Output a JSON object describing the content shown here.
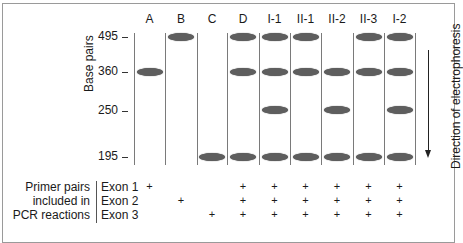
{
  "figure": {
    "y_axis_label": "Base pairs",
    "direction_label": "Direction of electrophoresis",
    "size_markers": [
      "495",
      "360",
      "250",
      "195"
    ],
    "lanes": [
      {
        "label": "A",
        "bands": [
          "360"
        ],
        "primers": {
          "exon1": "+",
          "exon2": "",
          "exon3": ""
        }
      },
      {
        "label": "B",
        "bands": [
          "495"
        ],
        "primers": {
          "exon1": "",
          "exon2": "+",
          "exon3": ""
        }
      },
      {
        "label": "C",
        "bands": [
          "195"
        ],
        "primers": {
          "exon1": "",
          "exon2": "",
          "exon3": "+"
        }
      },
      {
        "label": "D",
        "bands": [
          "495",
          "360",
          "195"
        ],
        "primers": {
          "exon1": "+",
          "exon2": "+",
          "exon3": "+"
        }
      },
      {
        "label": "I-1",
        "bands": [
          "495",
          "360",
          "250",
          "195"
        ],
        "primers": {
          "exon1": "+",
          "exon2": "+",
          "exon3": "+"
        }
      },
      {
        "label": "II-1",
        "bands": [
          "495",
          "360",
          "195"
        ],
        "primers": {
          "exon1": "+",
          "exon2": "+",
          "exon3": "+"
        }
      },
      {
        "label": "II-2",
        "bands": [
          "360",
          "250",
          "195"
        ],
        "primers": {
          "exon1": "+",
          "exon2": "+",
          "exon3": "+"
        }
      },
      {
        "label": "II-3",
        "bands": [
          "495",
          "360",
          "195"
        ],
        "primers": {
          "exon1": "+",
          "exon2": "+",
          "exon3": "+"
        }
      },
      {
        "label": "I-2",
        "bands": [
          "495",
          "360",
          "250",
          "195"
        ],
        "primers": {
          "exon1": "+",
          "exon2": "+",
          "exon3": "+"
        }
      }
    ],
    "primer_table": {
      "row_header_lines": [
        "Primer pairs",
        "included in",
        "PCR reactions"
      ],
      "exon_labels": [
        "Exon 1",
        "Exon 2",
        "Exon 3"
      ]
    }
  },
  "colors": {
    "band": "#5e5e5e",
    "lane_line": "#7a7a7a",
    "frame": "#9a9a9a"
  }
}
